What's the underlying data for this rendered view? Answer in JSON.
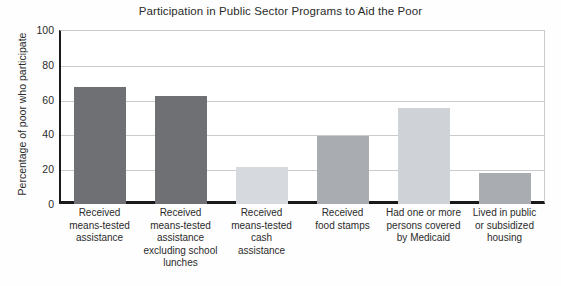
{
  "chart_data": {
    "type": "bar",
    "title": "Participation in Public Sector Programs to Aid the Poor",
    "xlabel": "",
    "ylabel": "Percentage of poor who participate",
    "ylim": [
      0,
      100
    ],
    "ytick_labels": [
      "100",
      "80",
      "60",
      "40",
      "20",
      "0"
    ],
    "yticks": [
      100,
      80,
      60,
      40,
      20,
      0
    ],
    "grid": true,
    "legend": "none",
    "categories": [
      "Received means-tested assistance",
      "Received means-tested assistance excluding school lunches",
      "Received means-tested cash assistance",
      "Received food stamps",
      "Had one or more persons covered by Medicaid",
      "Lived in public or subsidized housing"
    ],
    "category_lines": [
      [
        "Received",
        "means-tested",
        "assistance"
      ],
      [
        "Received",
        "means-tested",
        "assistance",
        "excluding school",
        "lunches"
      ],
      [
        "Received",
        "means-tested",
        "cash",
        "assistance"
      ],
      [
        "Received",
        "food stamps"
      ],
      [
        "Had one or more",
        "persons covered",
        "by Medicaid"
      ],
      [
        "Lived in public",
        "or subsidized",
        "housing"
      ]
    ],
    "values": [
      67,
      62,
      21,
      39,
      55,
      18
    ],
    "bar_colors": [
      "#6f7073",
      "#6f7073",
      "#d6d9dd",
      "#a9adb1",
      "#cfd3d7",
      "#a9adb1"
    ]
  },
  "colors": {
    "axis": "#1a1a1a",
    "gridline": "#c9cbcd",
    "text": "#2b2b2b",
    "background": "#ffffff"
  }
}
